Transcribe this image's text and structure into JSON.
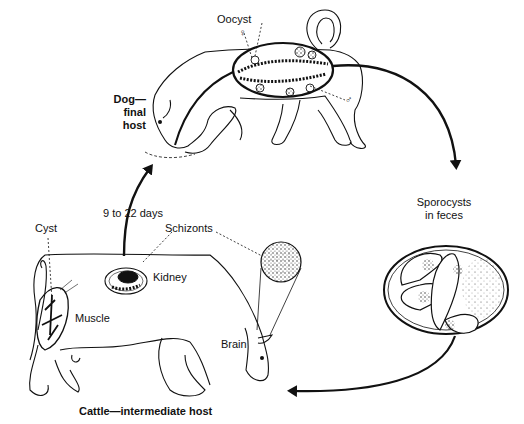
{
  "diagram": {
    "hosts": {
      "final": {
        "line1": "Dog—",
        "line2": "final",
        "line3": "host"
      },
      "intermediate": {
        "label": "Cattle—intermediate host"
      }
    },
    "labels": {
      "oocyst": "Oocyst",
      "female_symbol": "♀",
      "male_symbol": "♂",
      "transition_days": "9 to 22 days",
      "sporocysts_line1": "Sporocysts",
      "sporocysts_line2": "in feces",
      "cyst": "Cyst",
      "schizonts": "Schizonts",
      "kidney": "Kidney",
      "muscle": "Muscle",
      "brain": "Brain"
    },
    "colors": {
      "ink": "#111111",
      "background": "#ffffff"
    },
    "arrows": [
      {
        "from": "dog",
        "to": "sporocysts",
        "direction": "clockwise-down"
      },
      {
        "from": "sporocysts",
        "to": "cattle",
        "direction": "down-left"
      },
      {
        "from": "cattle",
        "to": "dog",
        "label_ref": "transition_days",
        "direction": "up"
      }
    ]
  }
}
